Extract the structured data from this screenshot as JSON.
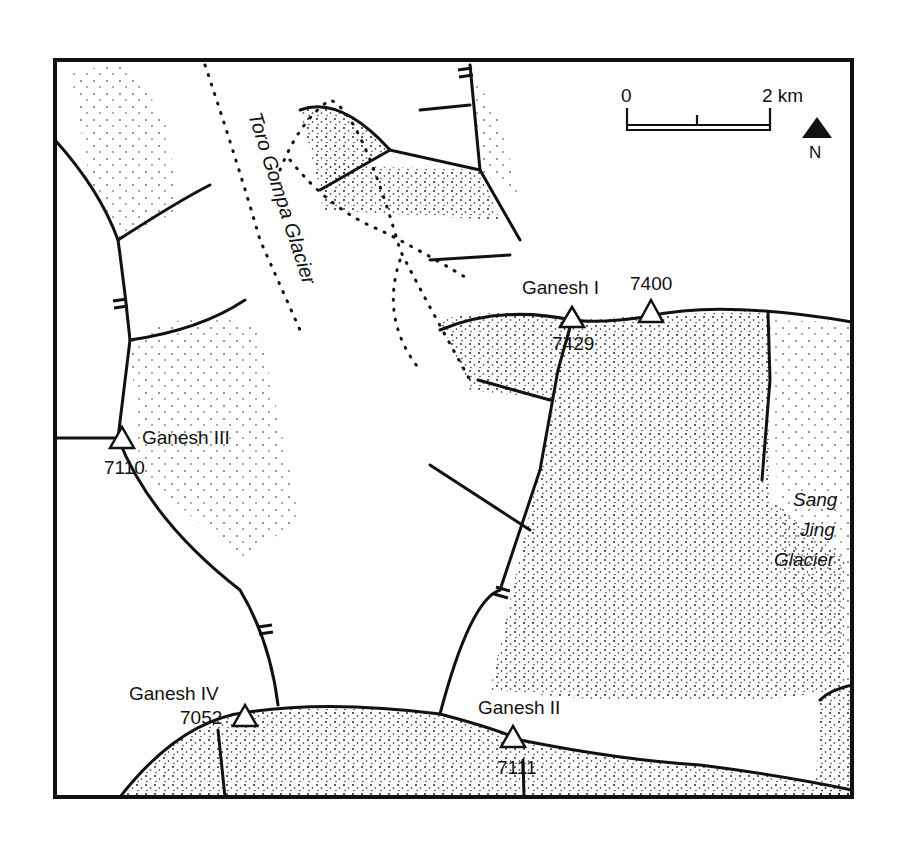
{
  "map": {
    "type": "topographic sketch map",
    "colors": {
      "ink": "#111111",
      "paper": "#ffffff"
    },
    "scale_bar": {
      "start_label": "0",
      "end_label": "2 km"
    },
    "north_arrow": {
      "label": "N"
    },
    "peaks": [
      {
        "name": "Ganesh I",
        "elevation": "7429"
      },
      {
        "name": "",
        "elevation": "7400"
      },
      {
        "name": "Ganesh III",
        "elevation": "7110"
      },
      {
        "name": "Ganesh IV",
        "elevation": "7052"
      },
      {
        "name": "Ganesh II",
        "elevation": "7111"
      }
    ],
    "glaciers": [
      {
        "name": "Toro Gompa Glacier"
      },
      {
        "name_lines": [
          "Sang",
          "Jing",
          "Glacier"
        ]
      }
    ]
  }
}
